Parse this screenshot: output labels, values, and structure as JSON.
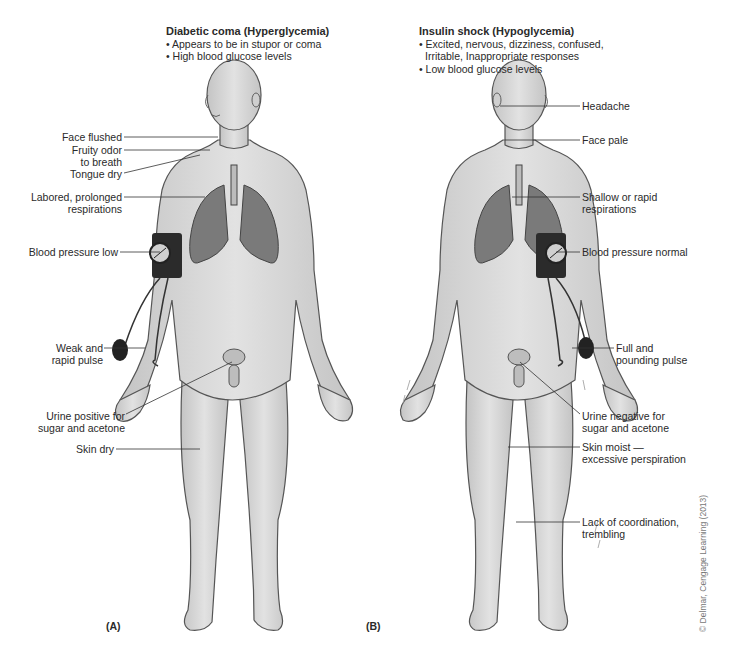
{
  "figure_a": {
    "panel_label": "(A)",
    "title": "Diabetic coma (Hyperglycemia)",
    "bullets": [
      "• Appears to be in stupor or coma",
      "• High blood glucose levels"
    ],
    "labels": [
      {
        "text": "Face flushed"
      },
      {
        "text": "Fruity odor"
      },
      {
        "text": "to breath"
      },
      {
        "text": "Tongue dry"
      },
      {
        "text": "Labored, prolonged"
      },
      {
        "text": "respirations"
      },
      {
        "text": "Blood pressure low"
      },
      {
        "text": "Weak and"
      },
      {
        "text": "rapid pulse"
      },
      {
        "text": "Urine positive for"
      },
      {
        "text": "sugar and acetone"
      },
      {
        "text": "Skin dry"
      }
    ]
  },
  "figure_b": {
    "panel_label": "(B)",
    "title": "Insulin shock (Hypoglycemia)",
    "bullets": [
      "• Excited, nervous, dizziness, confused,",
      "  Irritable, Inappropriate responses",
      "• Low blood glucose levels"
    ],
    "labels": [
      {
        "text": "Headache"
      },
      {
        "text": "Face pale"
      },
      {
        "text": "Shallow or rapid"
      },
      {
        "text": "respirations"
      },
      {
        "text": "Blood pressure normal"
      },
      {
        "text": "Full and"
      },
      {
        "text": "pounding pulse"
      },
      {
        "text": "Urine negative for"
      },
      {
        "text": "sugar and acetone"
      },
      {
        "text": "Skin moist —"
      },
      {
        "text": "excessive perspiration"
      },
      {
        "text": "Lack of coordination,"
      },
      {
        "text": "trembling"
      }
    ]
  },
  "copyright": "© Delmar, Cengage Learning (2013)",
  "colors": {
    "skin": "#d9d9d9",
    "outline": "#555555",
    "lungs": "#6e6e6e",
    "cuff": "#2b2b2b",
    "text": "#2a2a2a"
  }
}
